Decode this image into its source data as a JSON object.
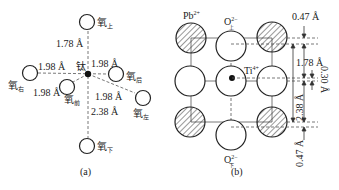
{
  "panel_a": {
    "caption": "(a)",
    "center_atom": "钛",
    "atoms": {
      "top": {
        "label": "氧",
        "sub": "上"
      },
      "right_far_left": {
        "label": "氧",
        "sub": "右"
      },
      "back": {
        "label": "氧",
        "sub": "后"
      },
      "front": {
        "label": "氧",
        "sub": "前"
      },
      "left_lower_right": {
        "label": "氧",
        "sub": "左"
      },
      "bottom": {
        "label": "氧",
        "sub": "下"
      }
    },
    "distances": {
      "top": "1.78 Å",
      "right": "1.98 Å",
      "back": "1.98 Å",
      "front": "1.98 Å",
      "left": "1.98 Å",
      "bottom": "2.38 Å"
    }
  },
  "panel_b": {
    "caption": "(b)",
    "labels": {
      "pb": "Pb",
      "pb_charge": "2+",
      "o_top": "O",
      "o_top_charge": "2−",
      "o_top_sub": "上",
      "ti": "Ti",
      "ti_charge": "4+",
      "o_bottom": "O",
      "o_bottom_charge": "2−",
      "o_bottom_sub": "下"
    },
    "dimensions": {
      "top_offset": "0.47 Å",
      "upper": "1.78 Å",
      "ti_offset": "0.30 Å",
      "lower": "2.38 Å",
      "bottom_offset": "0.47 Å"
    }
  }
}
